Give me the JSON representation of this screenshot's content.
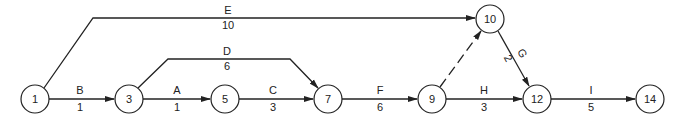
{
  "diagram": {
    "type": "activity-on-arrow network",
    "nodes": [
      {
        "id": "1",
        "x": 35,
        "y": 99
      },
      {
        "id": "3",
        "x": 129,
        "y": 99
      },
      {
        "id": "5",
        "x": 225,
        "y": 99
      },
      {
        "id": "7",
        "x": 328,
        "y": 99
      },
      {
        "id": "9",
        "x": 432,
        "y": 99
      },
      {
        "id": "10",
        "x": 490,
        "y": 19
      },
      {
        "id": "12",
        "x": 537,
        "y": 99
      },
      {
        "id": "14",
        "x": 650,
        "y": 99
      }
    ],
    "activities": [
      {
        "name": "B",
        "duration": "1",
        "from": "1",
        "to": "3"
      },
      {
        "name": "A",
        "duration": "1",
        "from": "3",
        "to": "5"
      },
      {
        "name": "C",
        "duration": "3",
        "from": "5",
        "to": "7"
      },
      {
        "name": "D",
        "duration": "6",
        "from": "3",
        "to": "7"
      },
      {
        "name": "E",
        "duration": "10",
        "from": "1",
        "to": "10"
      },
      {
        "name": "F",
        "duration": "6",
        "from": "7",
        "to": "9"
      },
      {
        "name": "G",
        "duration": "2",
        "from": "10",
        "to": "12"
      },
      {
        "name": "H",
        "duration": "3",
        "from": "9",
        "to": "12"
      },
      {
        "name": "I",
        "duration": "5",
        "from": "12",
        "to": "14"
      },
      {
        "name": "",
        "duration": "",
        "from": "9",
        "to": "10",
        "dummy": true
      }
    ]
  },
  "labels": {
    "n1": "1",
    "n3": "3",
    "n5": "5",
    "n7": "7",
    "n9": "9",
    "n10": "10",
    "n12": "12",
    "n14": "14",
    "B": "B",
    "B_dur": "1",
    "A": "A",
    "A_dur": "1",
    "C": "C",
    "C_dur": "3",
    "D": "D",
    "D_dur": "6",
    "E": "E",
    "E_dur": "10",
    "F": "F",
    "F_dur": "6",
    "G": "G",
    "G_dur": "2",
    "H": "H",
    "H_dur": "3",
    "I": "I",
    "I_dur": "5"
  }
}
